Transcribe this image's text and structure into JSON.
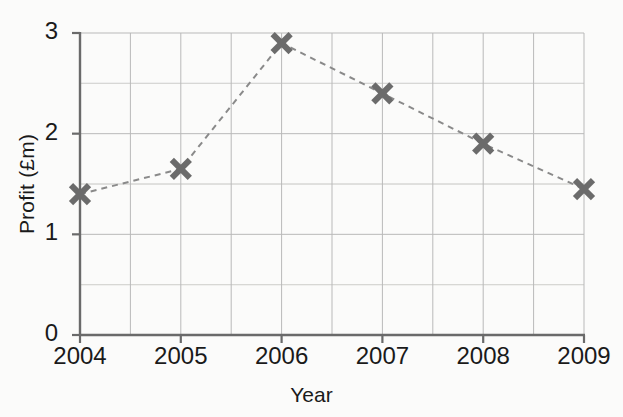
{
  "chart_data": {
    "type": "line",
    "title": "",
    "subtitle": "",
    "xlabel": "Year",
    "ylabel": "Profit (£m)",
    "categories": [
      "2004",
      "2005",
      "2006",
      "2007",
      "2008",
      "2009"
    ],
    "x": [
      2004,
      2005,
      2006,
      2007,
      2008,
      2009
    ],
    "values": [
      1.4,
      1.65,
      2.9,
      2.4,
      1.9,
      1.45
    ],
    "series": [
      {
        "name": "Profit",
        "values": [
          1.4,
          1.65,
          2.9,
          2.4,
          1.9,
          1.45
        ],
        "marker": "x",
        "marker_color": "#6b6b6b",
        "line_style": "dashed",
        "line_color": "#8a8a8a"
      }
    ],
    "xlim": [
      2004,
      2009
    ],
    "ylim": [
      0,
      3
    ],
    "ytick_labels": [
      "0",
      "1",
      "2",
      "3"
    ],
    "ytick_values": [
      0,
      1,
      2,
      3
    ],
    "xtick_labels": [
      "2004",
      "2005",
      "2006",
      "2007",
      "2008",
      "2009"
    ],
    "y_minor_gridlines": [
      0.5,
      1.5,
      2.5
    ],
    "y_major_gridlines": [
      0.5,
      1,
      1.5,
      2,
      2.5,
      3
    ],
    "x_gridlines": [
      2004.5,
      2005,
      2005.5,
      2006,
      2006.5,
      2007,
      2007.5,
      2008,
      2008.5,
      2009
    ],
    "grid": true,
    "legend": false,
    "legend_position": "none",
    "annotations": []
  },
  "style": {
    "background_color": "#fbfbfa",
    "axis_color": "#6a6a6a",
    "grid_color": "#b9b9b9",
    "minor_grid_color": "#d6d6d4",
    "text_color": "#1a1a1a",
    "marker_color": "#6b6b6b",
    "line_color": "#8a8a8a"
  },
  "geometry": {
    "plot_left": 80,
    "plot_right": 584,
    "plot_top": 33,
    "plot_bottom": 335
  }
}
